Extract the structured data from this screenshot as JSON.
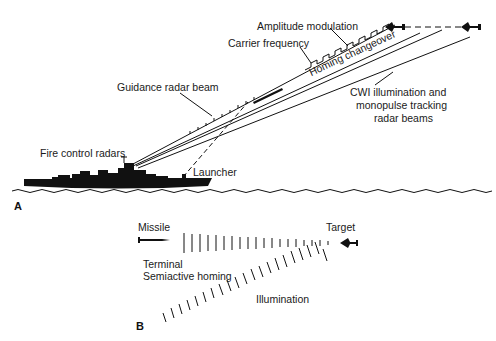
{
  "panel_a": {
    "letter": "A",
    "labels": {
      "amplitude_modulation": "Amplitude modulation",
      "carrier_frequency": "Carrier frequency",
      "homing_changeover": "Homing changeover",
      "guidance_radar_beam": "Guidance radar beam",
      "cwi_line1": "CWI illumination and",
      "cwi_line2": "monopulse tracking",
      "cwi_line3": "radar beams",
      "fire_control_radars": "Fire control radars",
      "launcher": "Launcher"
    }
  },
  "panel_b": {
    "letter": "B",
    "labels": {
      "missile": "Missile",
      "target": "Target",
      "terminal": "Terminal",
      "semiactive_homing": "Semiactive homing",
      "illumination": "Illumination"
    }
  },
  "colors": {
    "ink": "#111111",
    "background": "#ffffff"
  }
}
